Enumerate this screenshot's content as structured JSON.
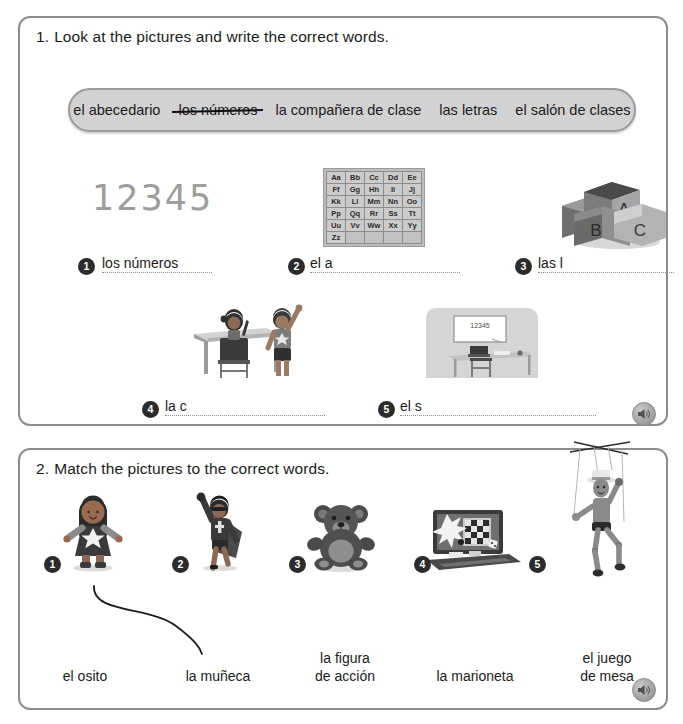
{
  "exercise1": {
    "number": "1.",
    "prompt": "Look at the pictures and write the correct words.",
    "word_bank": [
      {
        "text": "el abecedario",
        "struck": false
      },
      {
        "text": "los números",
        "struck": true
      },
      {
        "text": "la compañera de clase",
        "struck": false
      },
      {
        "text": "las letras",
        "struck": false
      },
      {
        "text": "el salón de clases",
        "struck": false
      }
    ],
    "items": [
      {
        "number": "1",
        "answer": "los números",
        "picture": "numbers-12345"
      },
      {
        "number": "2",
        "answer": "el a",
        "picture": "alphabet-chart"
      },
      {
        "number": "3",
        "answer": "las l",
        "picture": "abc-blocks"
      },
      {
        "number": "4",
        "answer": "la c",
        "picture": "two-classmates-at-desk"
      },
      {
        "number": "5",
        "answer": "el s",
        "picture": "classroom-with-whiteboard"
      }
    ],
    "alphabet_chart": {
      "rows": [
        [
          "Aa",
          "Bb",
          "Cc",
          "Dd",
          "Ee"
        ],
        [
          "Ff",
          "Gg",
          "Hh",
          "Ii",
          "Jj"
        ],
        [
          "Kk",
          "Ll",
          "Mm",
          "Nn",
          "Oo"
        ],
        [
          "Pp",
          "Qq",
          "Rr",
          "Ss",
          "Tt"
        ],
        [
          "Uu",
          "Vv",
          "Ww",
          "Xx",
          "Yy"
        ],
        [
          "Zz",
          "",
          "",
          "",
          ""
        ]
      ]
    },
    "numbers_graphic": "12345",
    "blocks": {
      "top": "A",
      "bottom_left": "B",
      "bottom_right": "C"
    },
    "whiteboard_text": "12345",
    "audio_label": "speaker-icon"
  },
  "exercise2": {
    "number": "2.",
    "prompt": "Match the pictures to the correct words.",
    "pictures": [
      {
        "number": "1",
        "picture": "doll"
      },
      {
        "number": "2",
        "picture": "action-figure"
      },
      {
        "number": "3",
        "picture": "teddy-bear"
      },
      {
        "number": "4",
        "picture": "board-game"
      },
      {
        "number": "5",
        "picture": "marionette"
      }
    ],
    "words": [
      "el osito",
      "la muñeca",
      "la figura\nde acción",
      "la marioneta",
      "el juego\nde mesa"
    ],
    "drawn_match": {
      "from": "1",
      "to": "la muñeca"
    },
    "audio_label": "speaker-icon"
  },
  "colors": {
    "card_border": "#8c8c8c",
    "bank_fill": "#d2d2d2",
    "marker_fill": "#2b2b2b",
    "ink": "#1b1b1b",
    "rule": "#8f8f8f"
  }
}
